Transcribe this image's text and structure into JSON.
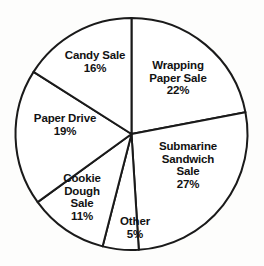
{
  "chart_data": {
    "type": "pie",
    "title": "",
    "subtitle": "",
    "xlabel": "",
    "ylabel": "",
    "legend_position": "none",
    "grid": false,
    "units": "percent",
    "total": 100,
    "start_angle_deg": 0,
    "direction": "clockwise",
    "categories": [
      "Wrapping Paper Sale",
      "Submarine Sandwich Sale",
      "Other",
      "Cookie Dough Sale",
      "Paper Drive",
      "Candy Sale"
    ],
    "values": [
      22,
      27,
      5,
      11,
      19,
      16
    ],
    "slices": [
      {
        "label": "Wrapping\nPaper Sale",
        "label_lines": [
          "Wrapping",
          "Paper Sale"
        ],
        "value": 22,
        "percent_text": "22%",
        "fill": "#ffffff",
        "stroke": "#1a1a1a",
        "label_x": 178,
        "label_y": 78
      },
      {
        "label": "Submarine\nSandwich\nSale",
        "label_lines": [
          "Submarine",
          "Sandwich",
          "Sale"
        ],
        "value": 27,
        "percent_text": "27%",
        "fill": "#ffffff",
        "stroke": "#1a1a1a",
        "label_x": 188,
        "label_y": 165
      },
      {
        "label": "Other",
        "label_lines": [
          "Other"
        ],
        "value": 5,
        "percent_text": "5%",
        "fill": "#ffffff",
        "stroke": "#1a1a1a",
        "label_x": 135,
        "label_y": 228
      },
      {
        "label": "Cookie\nDough\nSale",
        "label_lines": [
          "Cookie",
          "Dough",
          "Sale"
        ],
        "value": 11,
        "percent_text": "11%",
        "fill": "#ffffff",
        "stroke": "#1a1a1a",
        "label_x": 82,
        "label_y": 197
      },
      {
        "label": "Paper Drive",
        "label_lines": [
          "Paper Drive"
        ],
        "value": 19,
        "percent_text": "19%",
        "fill": "#ffffff",
        "stroke": "#1a1a1a",
        "label_x": 65,
        "label_y": 125
      },
      {
        "label": "Candy Sale",
        "label_lines": [
          "Candy Sale"
        ],
        "value": 16,
        "percent_text": "16%",
        "fill": "#ffffff",
        "stroke": "#1a1a1a",
        "label_x": 95,
        "label_y": 62
      }
    ],
    "geometry": {
      "center_x": 131.5,
      "center_y": 134,
      "radius": 116
    }
  }
}
